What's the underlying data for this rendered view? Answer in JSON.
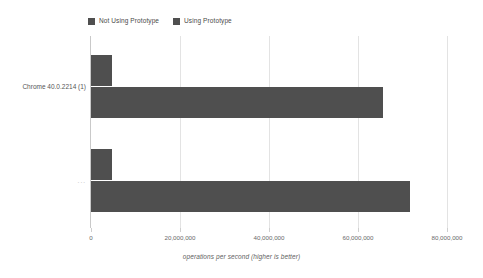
{
  "chart_data": {
    "type": "bar",
    "orientation": "horizontal",
    "title": "",
    "xlabel": "operations per second (higher is better)",
    "ylabel": "",
    "categories": [
      "Chrome 40.0.2214 (1)",
      "..."
    ],
    "series": [
      {
        "name": "Not Using Prototype",
        "values": [
          4700000,
          4700000
        ],
        "color": "#4f4f4f"
      },
      {
        "name": "Using Prototype",
        "values": [
          65600000,
          71700000
        ],
        "color": "#4f4f4f"
      }
    ],
    "xlim": [
      0,
      80000000
    ],
    "xticks": [
      0,
      20000000,
      40000000,
      60000000,
      80000000
    ],
    "xtick_labels": [
      "0",
      "20,000,000",
      "40,000,000",
      "60,000,000",
      "80,000,000"
    ],
    "grid": true,
    "grid_axis": "x",
    "legend_position": "top-left"
  },
  "legend": {
    "items": [
      {
        "label": "Not Using Prototype",
        "color": "#4f4f4f"
      },
      {
        "label": "Using Prototype",
        "color": "#4f4f4f"
      }
    ]
  },
  "axis": {
    "x_title": "operations per second (higher is better)",
    "tick_labels": [
      "0",
      "20,000,000",
      "40,000,000",
      "60,000,000",
      "80,000,000"
    ]
  },
  "categories": [
    {
      "label": "Chrome 40.0.2214 (1)"
    },
    {
      "label": "..."
    }
  ],
  "colors": {
    "bar": "#4f4f4f",
    "gridline": "#e3e3e3",
    "axis": "#c9c9c9",
    "background": "#ffffff",
    "text": "#555555"
  }
}
